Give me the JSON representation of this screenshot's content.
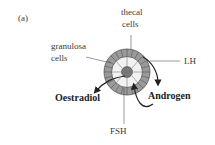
{
  "figure": {
    "panel_label": "(a)",
    "labels": {
      "thecal_line1": "thecal",
      "thecal_line2": "cells",
      "granulosa_line1": "granulosa",
      "granulosa_line2": "cells",
      "lh": "LH",
      "fsh": "FSH",
      "oestradiol": "Oestradiol",
      "androgen": "Androgen"
    },
    "colors": {
      "outer_ring": "#9a9a9a",
      "inner_ring": "#f2f2f2",
      "oocyte": "#777777",
      "lines": "#555555",
      "arrows": "#222222"
    }
  }
}
